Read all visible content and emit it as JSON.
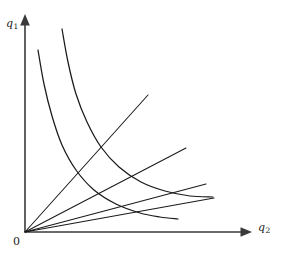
{
  "figure": {
    "background_color": "#ffffff",
    "line_color": "#1a1a1a",
    "axis_color": "#3a3a3a",
    "width": 282,
    "height": 257
  },
  "labels": {
    "y_axis": "q",
    "y_axis_sub": "1",
    "x_axis": "q",
    "x_axis_sub": "2",
    "origin": "0"
  },
  "chart_data": {
    "type": "line",
    "title": "",
    "xlabel": "q2",
    "ylabel": "q1",
    "grid": false,
    "legend": null,
    "axes": {
      "origin_px": [
        25,
        232
      ],
      "x_axis_end_px": [
        250,
        232
      ],
      "y_axis_end_px": [
        25,
        16
      ],
      "x_arrow": true,
      "y_arrow": true,
      "ticks": [],
      "tick_labels": []
    },
    "series": [
      {
        "name": "ray-1",
        "kind": "ray",
        "description": "steepest expansion ray from origin",
        "points_px": [
          [
            25,
            232
          ],
          [
            148,
            95
          ]
        ]
      },
      {
        "name": "ray-2",
        "kind": "ray",
        "description": "second expansion ray from origin",
        "points_px": [
          [
            25,
            232
          ],
          [
            186,
            148
          ]
        ]
      },
      {
        "name": "ray-3",
        "kind": "ray",
        "description": "third expansion ray from origin",
        "points_px": [
          [
            25,
            232
          ],
          [
            206,
            184
          ]
        ]
      },
      {
        "name": "ray-4",
        "kind": "ray",
        "description": "flattest expansion ray from origin",
        "points_px": [
          [
            25,
            232
          ],
          [
            214,
            198
          ]
        ]
      },
      {
        "name": "isoquant-inner",
        "kind": "curve",
        "description": "lower convex isoquant, decreasing and convex to origin",
        "points_px": [
          [
            38,
            50
          ],
          [
            44,
            84
          ],
          [
            52,
            116
          ],
          [
            62,
            145
          ],
          [
            76,
            170
          ],
          [
            94,
            190
          ],
          [
            116,
            204
          ],
          [
            140,
            213
          ],
          [
            160,
            217
          ],
          [
            178,
            219
          ]
        ]
      },
      {
        "name": "isoquant-outer",
        "kind": "curve",
        "description": "upper convex isoquant, decreasing and convex to origin",
        "points_px": [
          [
            62,
            29
          ],
          [
            68,
            62
          ],
          [
            76,
            94
          ],
          [
            87,
            122
          ],
          [
            101,
            147
          ],
          [
            119,
            167
          ],
          [
            141,
            182
          ],
          [
            165,
            191
          ],
          [
            190,
            196
          ],
          [
            213,
            197
          ]
        ]
      }
    ]
  }
}
